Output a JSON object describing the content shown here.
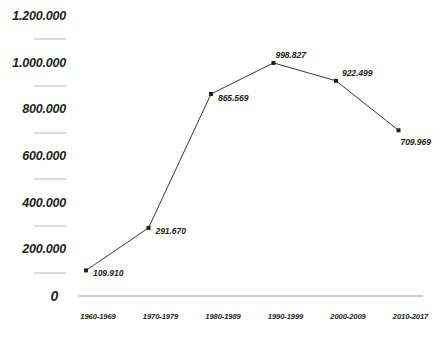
{
  "chart_data": {
    "type": "line",
    "title": "",
    "xlabel": "",
    "ylabel": "",
    "categories": [
      "1960-1969",
      "1970-1979",
      "1980-1989",
      "1990-1999",
      "2000-2009",
      "2010-2017"
    ],
    "values": [
      109910,
      291670,
      865569,
      998827,
      922499,
      709969
    ],
    "point_labels": [
      "109.910",
      "291.670",
      "865.569",
      "998.827",
      "922.499",
      "709.969"
    ],
    "ylim": [
      0,
      1200000
    ],
    "ytick_labels": [
      "1.200.000",
      "1.000.000",
      "800.000",
      "600.000",
      "400.000",
      "200.000",
      "0"
    ],
    "ytick_values": [
      1200000,
      1000000,
      800000,
      600000,
      400000,
      200000,
      0
    ],
    "yminor_values": [
      1100000,
      900000,
      700000,
      500000,
      300000,
      100000
    ],
    "grid": false,
    "legend": null,
    "series": [
      {
        "name": "",
        "values": [
          109910,
          291670,
          865569,
          998827,
          922499,
          709969
        ]
      }
    ],
    "colors": {
      "line": "#231f20",
      "marker": "#231f20",
      "text": "#231f20",
      "tick_dash": "#b9b9b9",
      "axis": "#9a9a9a",
      "background": "#ffffff"
    }
  }
}
